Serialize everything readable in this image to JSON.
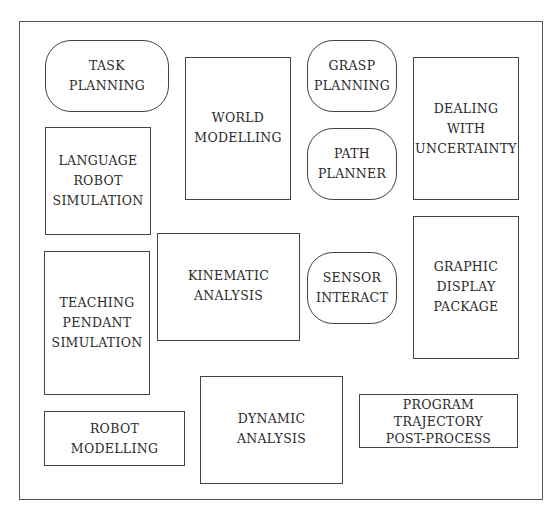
{
  "diagram": {
    "boxes": [
      {
        "id": "task-planning",
        "label": "TASK\nPLANNING",
        "shape": "rounded"
      },
      {
        "id": "world-modelling",
        "label": "WORLD\nMODELLING",
        "shape": "rect"
      },
      {
        "id": "grasp-planning",
        "label": "GRASP\nPLANNING",
        "shape": "rounded"
      },
      {
        "id": "dealing-with-uncertainty",
        "label": "DEALING\nWITH\nUNCERTAINTY",
        "shape": "rect"
      },
      {
        "id": "language-robot-simulation",
        "label": "LANGUAGE\nROBOT\nSIMULATION",
        "shape": "rect"
      },
      {
        "id": "path-planner",
        "label": "PATH\nPLANNER",
        "shape": "rounded"
      },
      {
        "id": "kinematic-analysis",
        "label": "KINEMATIC\nANALYSIS",
        "shape": "rect"
      },
      {
        "id": "sensor-interact",
        "label": "SENSOR\nINTERACT",
        "shape": "rounded"
      },
      {
        "id": "graphic-display-package",
        "label": "GRAPHIC\nDISPLAY\nPACKAGE",
        "shape": "rect"
      },
      {
        "id": "teaching-pendant-simulation",
        "label": "TEACHING\nPENDANT\nSIMULATION",
        "shape": "rect"
      },
      {
        "id": "robot-modelling",
        "label": "ROBOT\nMODELLING",
        "shape": "rect"
      },
      {
        "id": "dynamic-analysis",
        "label": "DYNAMIC\nANALYSIS",
        "shape": "rect"
      },
      {
        "id": "program-trajectory-post-process",
        "label": "PROGRAM\nTRAJECTORY\nPOST-PROCESS",
        "shape": "rect"
      }
    ]
  }
}
